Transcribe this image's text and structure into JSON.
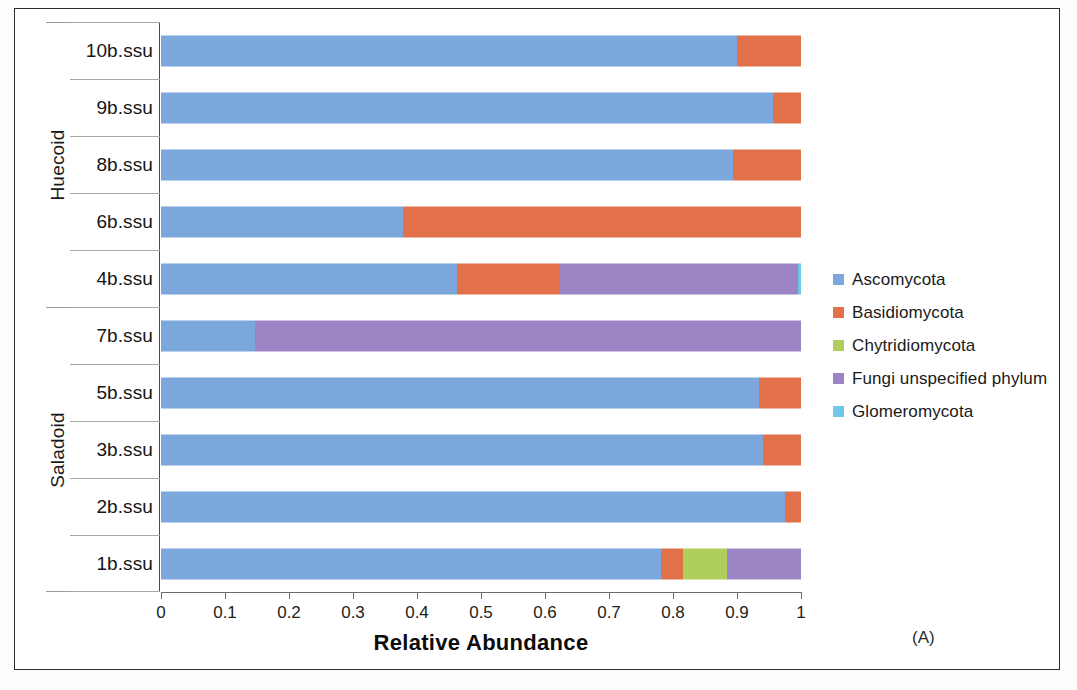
{
  "chart_data": {
    "type": "bar",
    "orientation": "horizontal",
    "stacked": true,
    "normalized": true,
    "title": "",
    "xlabel": "Relative Abundance",
    "ylabel": "",
    "xlim": [
      0,
      1
    ],
    "xticks": [
      "0",
      "0.1",
      "0.2",
      "0.3",
      "0.4",
      "0.5",
      "0.6",
      "0.7",
      "0.8",
      "0.9",
      "1"
    ],
    "grid": false,
    "legend_position": "right",
    "panel_label": "(A)",
    "categories": [
      "10b.ssu",
      "9b.ssu",
      "8b.ssu",
      "6b.ssu",
      "4b.ssu",
      "7b.ssu",
      "5b.ssu",
      "3b.ssu",
      "2b.ssu",
      "1b.ssu"
    ],
    "group_labels": [
      "Huecoid",
      "Saladoid"
    ],
    "groups": [
      {
        "label": "Huecoid",
        "categories": [
          "10b.ssu",
          "9b.ssu",
          "8b.ssu",
          "6b.ssu",
          "4b.ssu"
        ]
      },
      {
        "label": "Saladoid",
        "categories": [
          "7b.ssu",
          "5b.ssu",
          "3b.ssu",
          "2b.ssu",
          "1b.ssu"
        ]
      }
    ],
    "series": [
      {
        "name": "Ascomycota",
        "color": "#7ba7dd",
        "values": [
          0.9,
          0.956,
          0.893,
          0.378,
          0.462,
          0.147,
          0.934,
          0.941,
          0.975,
          0.781
        ]
      },
      {
        "name": "Basidiomycota",
        "color": "#e2714a",
        "values": [
          0.1,
          0.044,
          0.107,
          0.622,
          0.161,
          0.0,
          0.066,
          0.059,
          0.025,
          0.035
        ]
      },
      {
        "name": "Chytridiomycota",
        "color": "#b0ce5c",
        "values": [
          0.0,
          0.0,
          0.0,
          0.0,
          0.0,
          0.0,
          0.0,
          0.0,
          0.0,
          0.069
        ]
      },
      {
        "name": "Fungi unspecified phylum",
        "color": "#9b85c4",
        "values": [
          0.0,
          0.0,
          0.0,
          0.0,
          0.373,
          0.853,
          0.0,
          0.0,
          0.0,
          0.115
        ]
      },
      {
        "name": "Glomeromycota",
        "color": "#6ec8ea",
        "values": [
          0.0,
          0.0,
          0.0,
          0.0,
          0.004,
          0.0,
          0.0,
          0.0,
          0.0,
          0.0
        ]
      }
    ]
  },
  "legend": {
    "items": [
      {
        "label": "Ascomycota",
        "color": "#7ba7dd"
      },
      {
        "label": "Basidiomycota",
        "color": "#e2714a"
      },
      {
        "label": "Chytridiomycota",
        "color": "#b0ce5c"
      },
      {
        "label": "Fungi unspecified phylum",
        "color": "#9b85c4"
      },
      {
        "label": "Glomeromycota",
        "color": "#6ec8ea"
      }
    ]
  },
  "axis": {
    "x_title": "Relative Abundance"
  },
  "annotation": {
    "panel": "(A)"
  }
}
